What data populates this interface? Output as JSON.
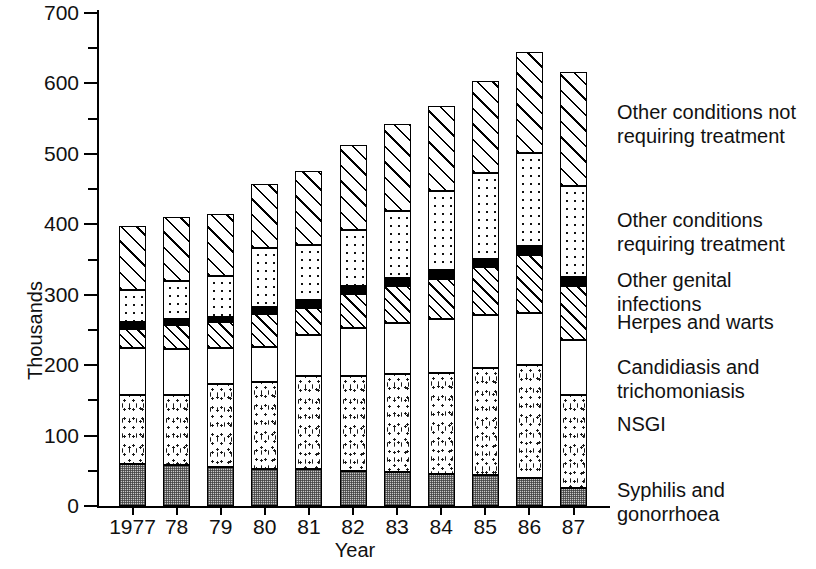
{
  "chart_data": {
    "type": "bar",
    "subtype": "stacked-bar",
    "title": "",
    "xlabel": "Year",
    "ylabel": "Thousands",
    "ylim": [
      0,
      700
    ],
    "ytick_labels": [
      "0",
      "100",
      "200",
      "300",
      "400",
      "500",
      "600",
      "700"
    ],
    "ytick_values": [
      0,
      100,
      200,
      300,
      400,
      500,
      600,
      700
    ],
    "yminor_step": 50,
    "grid": false,
    "legend_position": "right",
    "categories": [
      "1977",
      "78",
      "79",
      "80",
      "81",
      "82",
      "83",
      "84",
      "85",
      "86",
      "87"
    ],
    "series": [
      {
        "name": "Syphilis and gonorrhoea",
        "pattern": "dense-crosshatch-grey",
        "values": [
          60,
          58,
          55,
          53,
          52,
          50,
          48,
          46,
          44,
          40,
          25
        ]
      },
      {
        "name": "NSGI",
        "pattern": "coarse-stipple",
        "values": [
          97,
          100,
          118,
          123,
          132,
          135,
          140,
          143,
          152,
          160,
          133
        ]
      },
      {
        "name": "Candidiasis and trichomoniasis",
        "pattern": "plain-white",
        "values": [
          67,
          65,
          52,
          50,
          59,
          68,
          72,
          77,
          75,
          74,
          77
        ]
      },
      {
        "name": "Herpes and warts",
        "pattern": "diagonal-hatch",
        "values": [
          28,
          34,
          36,
          46,
          38,
          48,
          52,
          57,
          68,
          83,
          78
        ]
      },
      {
        "name": "Other genital infections",
        "pattern": "solid-black",
        "values": [
          9,
          8,
          8,
          11,
          11,
          11,
          12,
          12,
          12,
          12,
          12
        ]
      },
      {
        "name": "Other conditions requiring treatment",
        "pattern": "dot-grid",
        "values": [
          46,
          55,
          57,
          84,
          78,
          80,
          95,
          112,
          122,
          132,
          130
        ]
      },
      {
        "name": "Other conditions not requiring treatment",
        "pattern": "wide-diagonal-hatch",
        "values": [
          91,
          90,
          89,
          90,
          106,
          121,
          124,
          121,
          131,
          143,
          161
        ]
      }
    ],
    "totals": [
      398,
      410,
      415,
      457,
      476,
      513,
      543,
      568,
      604,
      644,
      616
    ]
  },
  "legend": {
    "items": [
      {
        "label": "Other conditions not\nrequiring treatment"
      },
      {
        "label": "Other conditions\nrequiring treatment"
      },
      {
        "label": "Other genital infections"
      },
      {
        "label": "Herpes and warts"
      },
      {
        "label": "Candidiasis and\ntrichomoniasis"
      },
      {
        "label": "NSGI"
      },
      {
        "label": "Syphilis and gonorrhoea"
      }
    ]
  },
  "colors": {
    "axis": "#000000",
    "text": "#111111",
    "syphilis_fill": "#c9c9c9",
    "genital_fill": "#000000",
    "background": "#ffffff"
  }
}
